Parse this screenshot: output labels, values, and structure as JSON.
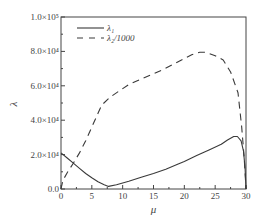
{
  "chart_data": {
    "type": "line",
    "title": "",
    "xlabel": "μ",
    "ylabel": "λ",
    "xlim": [
      0,
      30
    ],
    "ylim": [
      0,
      100000
    ],
    "grid": false,
    "legend_position": "top-left",
    "x_ticks": [
      0,
      5,
      10,
      15,
      20,
      25,
      30
    ],
    "x_tick_labels": [
      "0",
      "5",
      "10",
      "15",
      "20",
      "25",
      "30"
    ],
    "y_ticks": [
      0,
      20000,
      40000,
      60000,
      80000,
      100000
    ],
    "y_tick_labels": [
      "0.0",
      "2.0×10⁴",
      "4.0×10⁴",
      "6.0×10⁴",
      "8.0×10⁴",
      "1.0×10⁵"
    ],
    "series": [
      {
        "name": "λ₁",
        "style": "solid",
        "x": [
          0,
          1,
          2,
          3,
          4,
          5,
          6,
          7,
          7.7,
          9,
          11,
          13,
          15,
          17,
          19,
          20,
          22,
          24,
          26,
          27,
          28,
          28.6,
          29.2,
          29.6,
          29.85,
          30
        ],
        "y": [
          21000,
          18000,
          15000,
          12000,
          9000,
          6500,
          4200,
          2500,
          1500,
          2500,
          4500,
          6800,
          9000,
          11500,
          14500,
          16000,
          19500,
          22700,
          26000,
          28500,
          30500,
          30500,
          28000,
          22000,
          12000,
          0
        ]
      },
      {
        "name": "λ₂/1000",
        "style": "dashed",
        "x": [
          0,
          0.3,
          1,
          2,
          3,
          4,
          5,
          6,
          6.6,
          8,
          10.9,
          13,
          16.3,
          19,
          21.2,
          22.5,
          23.5,
          25,
          26.3,
          27.5,
          28.7,
          29.3,
          29.7,
          30
        ],
        "y": [
          0,
          5000,
          9500,
          15000,
          21000,
          28000,
          36000,
          44000,
          48800,
          53500,
          60500,
          64000,
          69000,
          74000,
          78000,
          79500,
          79500,
          77500,
          75000,
          68000,
          56000,
          36000,
          18000,
          0
        ]
      }
    ]
  },
  "legend": {
    "items": [
      {
        "label": "λ₁",
        "style": "solid"
      },
      {
        "label": "λ₂/1000",
        "style": "dashed"
      }
    ]
  },
  "colors": {
    "line": "#3a3a3a",
    "axis": "#444444",
    "background": "#ffffff"
  }
}
